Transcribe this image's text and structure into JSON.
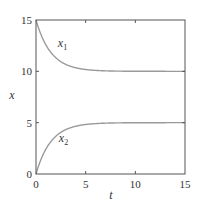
{
  "chart_data": {
    "type": "line",
    "title": "",
    "xlabel": "t",
    "ylabel": "x",
    "xlim": [
      0,
      15
    ],
    "ylim": [
      0,
      15
    ],
    "xticks": [
      0,
      5,
      10,
      15
    ],
    "yticks": [
      0,
      5,
      10,
      15
    ],
    "xtick_labels": [
      "0",
      "5",
      "10",
      "15"
    ],
    "ytick_labels": [
      "0",
      "5",
      "10",
      "15"
    ],
    "grid": false,
    "legend": "none (inline curve labels)",
    "series": [
      {
        "name": "x1",
        "label_main": "x",
        "label_sub": "1",
        "color": "#9a9a9a",
        "label_pos": [
          2.2,
          12.4
        ],
        "x": [
          0,
          0.5,
          1,
          1.5,
          2,
          2.5,
          3,
          4,
          5,
          6,
          7,
          8,
          10,
          12,
          15
        ],
        "values": [
          15,
          13.58,
          12.57,
          11.84,
          11.32,
          10.94,
          10.68,
          10.35,
          10.18,
          10.09,
          10.05,
          10.02,
          10.01,
          10.0,
          10.0
        ]
      },
      {
        "name": "x2",
        "label_main": "x",
        "label_sub": "2",
        "color": "#9a9a9a",
        "label_pos": [
          2.3,
          3.1
        ],
        "x": [
          0,
          0.5,
          1,
          1.5,
          2,
          2.5,
          3,
          4,
          5,
          6,
          7,
          8,
          10,
          12,
          15
        ],
        "values": [
          0,
          1.42,
          2.43,
          3.16,
          3.68,
          4.06,
          4.32,
          4.65,
          4.82,
          4.91,
          4.95,
          4.98,
          4.99,
          5.0,
          5.0
        ]
      }
    ]
  },
  "axes": {
    "frame_color": "#555555",
    "tick_color": "#555555"
  }
}
